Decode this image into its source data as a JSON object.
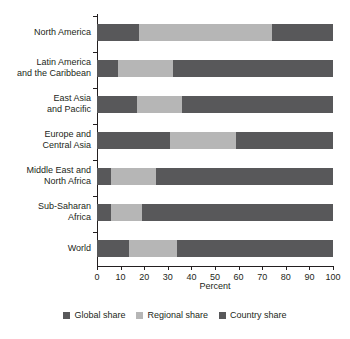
{
  "chart_data": {
    "type": "bar",
    "orientation": "horizontal",
    "stacked": true,
    "title": "",
    "xlabel": "Percent",
    "ylabel": "",
    "xlim": [
      0,
      100
    ],
    "xticks": [
      0,
      10,
      20,
      30,
      40,
      50,
      60,
      70,
      80,
      90,
      100
    ],
    "xticklabels": [
      "0",
      "10",
      "20",
      "30",
      "40",
      "50",
      "60",
      "70",
      "80",
      "90",
      "100"
    ],
    "grid": false,
    "legend_position": "bottom-center",
    "categories": [
      "North America",
      "Latin America and the Caribbean",
      "East Asia and Pacific",
      "Europe and Central Asia",
      "Middle East and North Africa",
      "Sub-Saharan Africa",
      "World"
    ],
    "category_label_lines": [
      [
        "North America"
      ],
      [
        "Latin America",
        "and the Caribbean"
      ],
      [
        "East Asia",
        "and Pacific"
      ],
      [
        "Europe and",
        "Central Asia"
      ],
      [
        "Middle East and",
        "North Africa"
      ],
      [
        "Sub-Saharan",
        "Africa"
      ],
      [
        "World"
      ]
    ],
    "series": [
      {
        "name": "Global share",
        "color": "#58585a",
        "values": [
          18,
          9,
          17,
          31,
          6,
          6,
          13.5
        ]
      },
      {
        "name": "Regional share",
        "color": "#b6b6b6",
        "values": [
          56,
          23,
          19,
          28,
          19,
          13,
          20.5
        ]
      },
      {
        "name": "Country share",
        "color": "#58585a",
        "values": [
          26,
          68,
          64,
          41,
          75,
          81,
          66
        ]
      }
    ]
  },
  "axis": {
    "x_title": "Percent"
  },
  "legend": {
    "items": [
      {
        "label": "Global share",
        "color": "#58585a"
      },
      {
        "label": "Regional share",
        "color": "#b6b6b6"
      },
      {
        "label": "Country share",
        "color": "#58585a"
      }
    ]
  }
}
